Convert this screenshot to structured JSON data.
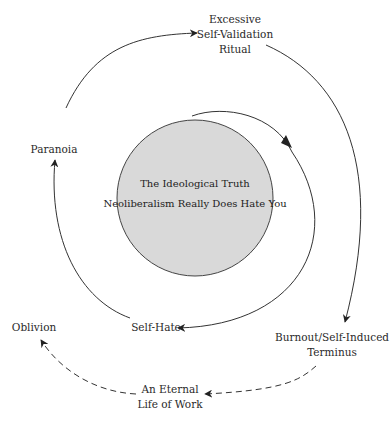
{
  "diagram": {
    "center": {
      "line1": "The Ideological Truth",
      "line2": "Neoliberalism Really Does Hate You",
      "fill": "#d9d9d9"
    },
    "nodes": {
      "ritual": {
        "line1": "Excessive",
        "line2": "Self-Validation",
        "line3": "Ritual"
      },
      "paranoia": {
        "label": "Paranoia"
      },
      "burnout": {
        "line1": "Burnout/Self-Induced",
        "line2": "Terminus"
      },
      "self_hate": {
        "label": "Self-Hate"
      },
      "oblivion": {
        "label": "Oblivion"
      },
      "work": {
        "line1": "An Eternal",
        "line2": "Life of Work"
      }
    },
    "edges": [
      {
        "from": "Paranoia",
        "to": "Excessive Self-Validation Ritual",
        "style": "solid"
      },
      {
        "from": "Excessive Self-Validation Ritual",
        "to": "Burnout/Self-Induced Terminus",
        "style": "solid"
      },
      {
        "from": "Center",
        "to": "Self-Hate",
        "style": "solid"
      },
      {
        "from": "Self-Hate",
        "to": "Paranoia",
        "style": "solid"
      },
      {
        "from": "Burnout/Self-Induced Terminus",
        "to": "An Eternal Life of Work",
        "style": "dashed"
      },
      {
        "from": "An Eternal Life of Work",
        "to": "Oblivion",
        "style": "dashed"
      }
    ],
    "colors": {
      "stroke": "#333333",
      "text": "#2a2a2a"
    }
  }
}
